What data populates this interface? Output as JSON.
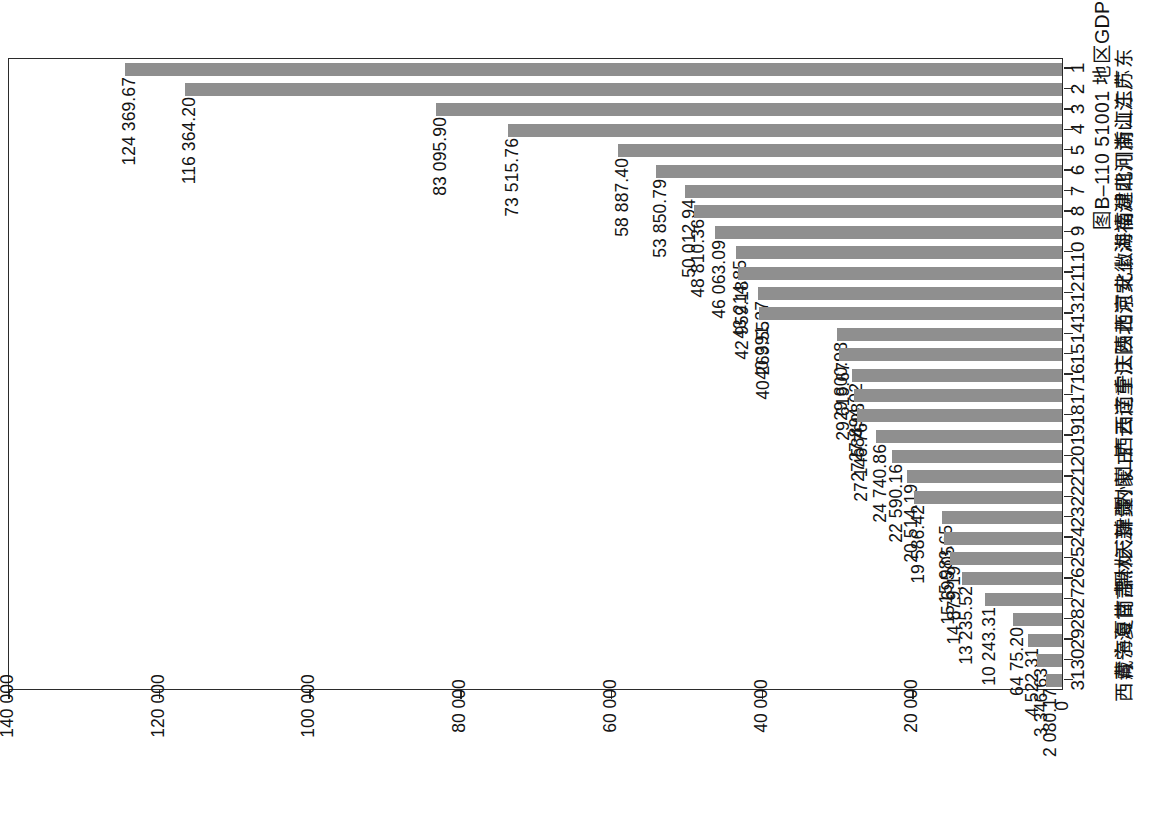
{
  "figure": {
    "caption": "图B–110  51001 地区GDP（亿元）",
    "orientation": "rotated-90-ccw",
    "bar_color": "#8f8f8f",
    "frame_color": "#2b2b2b"
  },
  "chart_data": {
    "type": "bar",
    "title": "图B–110  51001 地区GDP（亿元）",
    "xlabel": "",
    "ylabel": "亿元",
    "ylim": [
      0,
      140000
    ],
    "grid": false,
    "legend": null,
    "tick_labels": [
      "0",
      "20 000",
      "40 000",
      "60 000",
      "80 000",
      "100 000",
      "120 000",
      "140 000"
    ],
    "tick_values": [
      0,
      20000,
      40000,
      60000,
      80000,
      100000,
      120000,
      140000
    ],
    "ranks": [
      "1",
      "2",
      "3",
      "4",
      "5",
      "6",
      "7",
      "8",
      "9",
      "10",
      "11",
      "12",
      "13",
      "14",
      "15",
      "16",
      "17",
      "18",
      "19",
      "20",
      "21",
      "22",
      "23",
      "24",
      "25",
      "26",
      "27",
      "28",
      "29",
      "30",
      "31"
    ],
    "categories": [
      "广东",
      "江苏",
      "山东",
      "浙江",
      "河南",
      "四川",
      "湖北",
      "福建",
      "湖南",
      "上海",
      "安徽",
      "河北",
      "北京",
      "陕西",
      "江西",
      "重庆",
      "辽宁",
      "云南",
      "广西",
      "山西",
      "内蒙古",
      "贵州",
      "新疆",
      "天津",
      "黑龙江",
      "吉林",
      "甘肃",
      "海南",
      "宁夏",
      "青海",
      "西藏"
    ],
    "values": [
      124369.67,
      116364.2,
      83095.9,
      73515.76,
      58887.4,
      53850.79,
      50012.94,
      48810.36,
      46063.09,
      43214.85,
      42959.18,
      40391.27,
      40269.55,
      29800.98,
      29619.67,
      27894.02,
      27584.08,
      27146.76,
      24740.86,
      22590.16,
      20514.19,
      19586.42,
      15983.65,
      15695.05,
      14879.19,
      13235.52,
      10243.31,
      6475.2,
      4522.31,
      3346.63,
      2080.17
    ],
    "value_labels": [
      "124 369.67",
      "116 364.20",
      "83 095.90",
      "73 515.76",
      "58 887.40",
      "53 850.79",
      "50 012.94",
      "48 810.36",
      "46 063.09",
      "43 214.85",
      "42 959.18",
      "40 391.27",
      "40 269.55",
      "29 800.98",
      "29 619.67",
      "27 894.02",
      "27 584.08",
      "27 146.76",
      "24 740.86",
      "22 590.16",
      "20 514.19",
      "19 586.42",
      "15 983.65",
      "15 695.05",
      "14 879.19",
      "13 235.52",
      "10 243.31",
      "64 75.20",
      "4 522.31",
      "3 346.63",
      "2 080.17"
    ]
  }
}
